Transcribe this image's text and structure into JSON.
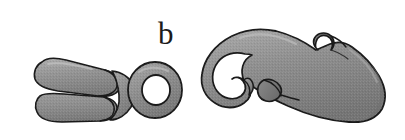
{
  "figure": {
    "panel_label": "b",
    "background_color": "#ffffff",
    "outline_color": "#1a1a1a",
    "fill_color": "#8d8d8d",
    "fill_light": "#a5a5a5",
    "fill_dark": "#6f6f6f",
    "hole_color": "#ffffff",
    "objects": [
      {
        "name": "forked-clevis-connector",
        "description": "Two-pronged forked connector with circular eyelet ring at right end",
        "parts": [
          "upper-prong",
          "lower-prong",
          "fork-notch",
          "body-junction",
          "eyelet-ring",
          "eyelet-hole"
        ]
      },
      {
        "name": "snap-hook",
        "description": "Curved snap hook with open throat, latch gate and tapered rounded body",
        "parts": [
          "hook-curl",
          "hook-throat",
          "latch-gate",
          "top-curl-notch",
          "tapered-body",
          "rounded-tail"
        ]
      }
    ]
  }
}
